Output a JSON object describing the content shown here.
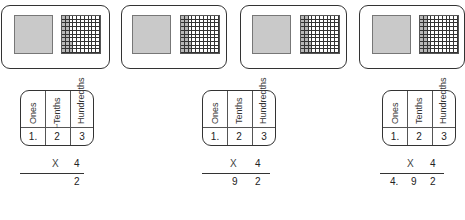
{
  "figure": {
    "colors": {
      "stroke": "#333333",
      "shaded": "#c9c9c9",
      "grid_shaded": "#b8b8b8"
    },
    "cards": [
      {
        "ones": 1,
        "tenths": 2,
        "hundredths": 3
      },
      {
        "ones": 1,
        "tenths": 2,
        "hundredths": 3
      },
      {
        "ones": 1,
        "tenths": 2,
        "hundredths": 3
      },
      {
        "ones": 1,
        "tenths": 2,
        "hundredths": 3
      }
    ],
    "headers": {
      "ones": "Ones",
      "tenths": "Tenths",
      "hundredths": "Hundredths"
    },
    "steps": [
      {
        "ones": "1.",
        "tenths": "2",
        "hundredths": "3",
        "carry": "1",
        "times": "X",
        "multiplier": "4",
        "answer": {
          "ones": "",
          "tenths": "",
          "hundredths": "2"
        }
      },
      {
        "ones": "1.",
        "tenths": "2",
        "hundredths": "3",
        "carry": "",
        "times": "X",
        "multiplier": "4",
        "answer": {
          "ones": "",
          "tenths": "9",
          "hundredths": "2"
        }
      },
      {
        "ones": "1.",
        "tenths": "2",
        "hundredths": "3",
        "carry": "",
        "times": "X",
        "multiplier": "4",
        "answer": {
          "ones": "4.",
          "tenths": "9",
          "hundredths": "2"
        }
      }
    ]
  }
}
